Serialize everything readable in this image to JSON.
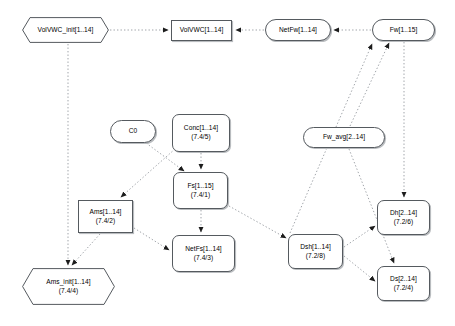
{
  "diagram": {
    "type": "flowchart",
    "title": "",
    "background_color": "#ffffff",
    "node_stroke_color": "#555a5f",
    "edge_color": "#8a8f94",
    "text_color": "#000000",
    "nodes": [
      {
        "id": "volvwc_init",
        "shape": "hexagon",
        "line1": "VolVWC_init[1..14]",
        "line2": "",
        "x": 22,
        "y": 17,
        "w": 87,
        "h": 26
      },
      {
        "id": "volvwc",
        "shape": "rect",
        "line1": "VolVWC[1..14]",
        "line2": "",
        "x": 171,
        "y": 20,
        "w": 61,
        "h": 21
      },
      {
        "id": "netfw",
        "shape": "stadium",
        "line1": "NetFw[1..14]",
        "line2": "",
        "x": 265,
        "y": 19,
        "w": 66,
        "h": 22
      },
      {
        "id": "fw",
        "shape": "stadium",
        "line1": "Fw[1..15]",
        "line2": "",
        "x": 372,
        "y": 19,
        "w": 63,
        "h": 22
      },
      {
        "id": "c0",
        "shape": "stadium",
        "line1": "C0",
        "line2": "",
        "x": 110,
        "y": 120,
        "w": 46,
        "h": 23
      },
      {
        "id": "conc",
        "shape": "round",
        "line1": "Conc[1..14]",
        "line2": "(7.4/5)",
        "x": 172,
        "y": 114,
        "w": 58,
        "h": 38
      },
      {
        "id": "fw_avg",
        "shape": "stadium",
        "line1": "Fw_avg[2..14]",
        "line2": "",
        "x": 303,
        "y": 127,
        "w": 82,
        "h": 21
      },
      {
        "id": "fs",
        "shape": "round",
        "line1": "Fs[1..15]",
        "line2": "(7.4/1)",
        "x": 173,
        "y": 172,
        "w": 55,
        "h": 37
      },
      {
        "id": "ams",
        "shape": "rect",
        "line1": "Ams[1..14]",
        "line2": "(7.4/2)",
        "x": 78,
        "y": 200,
        "w": 55,
        "h": 33
      },
      {
        "id": "dh",
        "shape": "round",
        "line1": "Dh[2..14]",
        "line2": "(7.2/6)",
        "x": 377,
        "y": 200,
        "w": 53,
        "h": 35
      },
      {
        "id": "dsh",
        "shape": "round",
        "line1": "Dsh[1..14]",
        "line2": "(7.2/8)",
        "x": 288,
        "y": 234,
        "w": 55,
        "h": 35
      },
      {
        "id": "netfs",
        "shape": "round",
        "line1": "NetFs[1..14]",
        "line2": "(7.4/3)",
        "x": 172,
        "y": 235,
        "w": 63,
        "h": 37
      },
      {
        "id": "ds",
        "shape": "round",
        "line1": "Ds[2..14]",
        "line2": "(7.2/4)",
        "x": 377,
        "y": 266,
        "w": 53,
        "h": 35
      },
      {
        "id": "ams_init",
        "shape": "hexagon",
        "line1": "Ams_init[1..14]",
        "line2": "(7.4/4)",
        "x": 22,
        "y": 268,
        "w": 93,
        "h": 37
      }
    ],
    "edges": [
      {
        "from": "volvwc_init",
        "to": "volvwc",
        "style": "dotted"
      },
      {
        "from": "netfw",
        "to": "volvwc",
        "style": "dotted"
      },
      {
        "from": "fw",
        "to": "netfw",
        "style": "dotted"
      },
      {
        "from": "volvwc_init",
        "to": "ams_init",
        "style": "dotted"
      },
      {
        "from": "conc",
        "to": "fs",
        "style": "dotted"
      },
      {
        "from": "fs",
        "to": "netfs",
        "style": "dotted"
      },
      {
        "from": "c0",
        "to": "fs",
        "style": "dotted"
      },
      {
        "from": "conc",
        "to": "ams",
        "style": "dotted"
      },
      {
        "from": "ams",
        "to": "ams_init",
        "style": "dotted"
      },
      {
        "from": "ams",
        "to": "netfs",
        "style": "dotted"
      },
      {
        "from": "fs",
        "to": "dsh",
        "style": "dotted"
      },
      {
        "from": "dsh",
        "to": "fw",
        "style": "dotted"
      },
      {
        "from": "dsh",
        "to": "dh",
        "style": "dotted"
      },
      {
        "from": "dsh",
        "to": "ds",
        "style": "dotted"
      },
      {
        "from": "fw",
        "to": "dh",
        "style": "dotted"
      },
      {
        "from": "fw_avg",
        "to": "fw",
        "style": "dotted"
      },
      {
        "from": "fw_avg",
        "to": "ds",
        "style": "dotted"
      }
    ]
  }
}
